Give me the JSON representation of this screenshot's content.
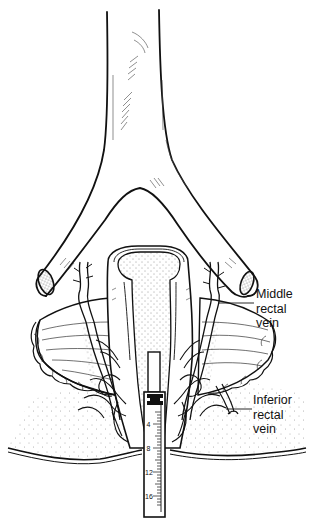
{
  "figure": {
    "type": "anatomical line illustration",
    "ink_color": "#111111",
    "background": "#ffffff"
  },
  "labels": {
    "middle_rectal_vein": {
      "line1": "Middle",
      "line2": "rectal",
      "line3": "vein"
    },
    "inferior_rectal_vein": {
      "line1": "Inferior",
      "line2": "rectal",
      "line3": "vein"
    }
  },
  "instrument": {
    "scale_marks": [
      "4",
      "8",
      "12",
      "16"
    ]
  }
}
